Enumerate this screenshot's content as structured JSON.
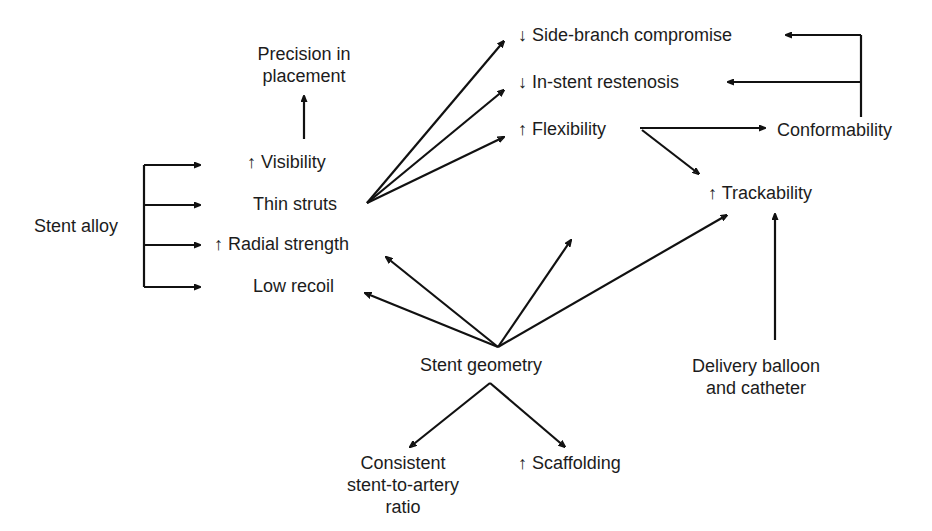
{
  "diagram": {
    "type": "flow-diagram",
    "colors": {
      "background": "#ffffff",
      "ink": "#111111"
    },
    "nodes": {
      "precision": {
        "lines": [
          "Precision in",
          "placement"
        ]
      },
      "visibility": {
        "prefix": "↑",
        "label": "Visibility"
      },
      "thin_struts": {
        "label": "Thin struts"
      },
      "radial_strength": {
        "prefix": "↑",
        "label": "Radial strength"
      },
      "low_recoil": {
        "label": "Low recoil"
      },
      "stent_alloy": {
        "label": "Stent alloy"
      },
      "side_branch": {
        "prefix": "↓",
        "label": "Side-branch compromise"
      },
      "restenosis": {
        "prefix": "↓",
        "label": "In-stent restenosis"
      },
      "flexibility": {
        "prefix": "↑",
        "label": "Flexibility"
      },
      "conformability": {
        "label": "Conformability"
      },
      "trackability": {
        "prefix": "↑",
        "label": "Trackability"
      },
      "delivery": {
        "lines": [
          "Delivery balloon",
          "and catheter"
        ]
      },
      "stent_geometry": {
        "label": "Stent geometry"
      },
      "consistent": {
        "lines": [
          "Consistent",
          "stent-to-artery",
          "ratio"
        ]
      },
      "scaffolding": {
        "prefix": "↑",
        "label": "Scaffolding"
      }
    },
    "edges": [
      {
        "from": "Stent alloy",
        "to": "↑ Visibility"
      },
      {
        "from": "Stent alloy",
        "to": "Thin struts"
      },
      {
        "from": "Stent alloy",
        "to": "↑ Radial strength"
      },
      {
        "from": "Stent alloy",
        "to": "Low recoil"
      },
      {
        "from": "↑ Visibility",
        "to": "Precision in placement"
      },
      {
        "from": "Thin struts",
        "to": "↓ Side-branch compromise"
      },
      {
        "from": "Thin struts",
        "to": "↓ In-stent restenosis"
      },
      {
        "from": "Thin struts",
        "to": "↑ Flexibility"
      },
      {
        "from": "↑ Flexibility",
        "to": "Conformability"
      },
      {
        "from": "↑ Flexibility",
        "to": "↑ Trackability"
      },
      {
        "from": "Conformability",
        "to": "↓ Side-branch compromise"
      },
      {
        "from": "Conformability",
        "to": "↓ In-stent restenosis"
      },
      {
        "from": "Delivery balloon and catheter",
        "to": "↑ Trackability"
      },
      {
        "from": "Stent geometry",
        "to": "↑ Radial strength"
      },
      {
        "from": "Stent geometry",
        "to": "Low recoil"
      },
      {
        "from": "Stent geometry",
        "to": "↑ Flexibility"
      },
      {
        "from": "Stent geometry",
        "to": "↑ Trackability"
      },
      {
        "from": "Stent geometry",
        "to": "Consistent stent-to-artery ratio"
      },
      {
        "from": "Stent geometry",
        "to": "↑ Scaffolding"
      }
    ]
  }
}
